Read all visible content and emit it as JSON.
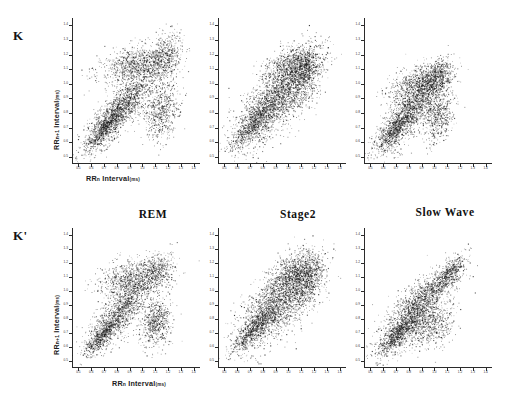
{
  "figure": {
    "row_labels": [
      {
        "id": "K",
        "text": "K"
      },
      {
        "id": "Kprime",
        "text": "K'"
      }
    ],
    "column_headers": [
      "REM",
      "Stage2",
      "Slow Wave"
    ],
    "axis": {
      "x_title_main": "RR",
      "x_title_sub": "n",
      "x_title_rest": " Interval",
      "x_title_unit": "(ms)",
      "y_title_main": "RR",
      "y_title_sub": "n+1",
      "y_title_rest": " Interval",
      "y_title_unit": "(ms)",
      "x_ticks": [
        "0.5",
        "0.6",
        "0.7",
        "0.8",
        "0.9",
        "1.0",
        "1.1",
        "1.2",
        "1.3",
        "1.4"
      ],
      "y_ticks": [
        "0.5",
        "0.6",
        "0.7",
        "0.8",
        "0.9",
        "1.0",
        "1.1",
        "1.2",
        "1.3",
        "1.4"
      ],
      "xlim": [
        0.45,
        1.45
      ],
      "ylim": [
        0.45,
        1.45
      ]
    }
  },
  "chart_data": {
    "type": "scatter",
    "xlabel": "RRn Interval (ms)",
    "ylabel": "RRn+1 Interval (ms)",
    "xlim": [
      0.45,
      1.45
    ],
    "ylim": [
      0.45,
      1.45
    ],
    "grid": false,
    "legend": "none",
    "rows": [
      "K",
      "K'"
    ],
    "columns": [
      "REM",
      "Stage2",
      "Slow Wave"
    ],
    "panels": [
      {
        "row": "K",
        "column": "REM",
        "n_points": 4200,
        "description": "Broad fan-shaped cluster with a dense diagonal band from 0.55 to 1.25 s plus a detached lower-right sub-cluster near (1.15, 0.80) and an upper band near (1.15, 1.20)",
        "clusters": [
          {
            "cx": 0.82,
            "cy": 0.82,
            "sx": 0.13,
            "sy": 0.13,
            "rho": 0.82,
            "weight": 0.38
          },
          {
            "cx": 0.95,
            "cy": 1.13,
            "sx": 0.14,
            "sy": 0.07,
            "rho": 0.35,
            "weight": 0.24
          },
          {
            "cx": 1.17,
            "cy": 1.18,
            "sx": 0.07,
            "sy": 0.09,
            "rho": 0.3,
            "weight": 0.12
          },
          {
            "cx": 1.14,
            "cy": 0.82,
            "sx": 0.07,
            "sy": 0.1,
            "rho": 0.1,
            "weight": 0.14
          },
          {
            "cx": 0.7,
            "cy": 0.7,
            "sx": 0.08,
            "sy": 0.08,
            "rho": 0.88,
            "weight": 0.12
          }
        ]
      },
      {
        "row": "K",
        "column": "Stage2",
        "n_points": 4200,
        "description": "Compact square-to-diamond cloud centred near (0.90, 0.90) with a dense upper-right diagonal ridge reaching 1.25 s",
        "clusters": [
          {
            "cx": 0.88,
            "cy": 0.88,
            "sx": 0.15,
            "sy": 0.15,
            "rho": 0.7,
            "weight": 0.5
          },
          {
            "cx": 1.05,
            "cy": 1.12,
            "sx": 0.11,
            "sy": 0.07,
            "rho": 0.4,
            "weight": 0.2
          },
          {
            "cx": 1.12,
            "cy": 1.05,
            "sx": 0.07,
            "sy": 0.11,
            "rho": 0.4,
            "weight": 0.15
          },
          {
            "cx": 0.72,
            "cy": 0.72,
            "sx": 0.08,
            "sy": 0.08,
            "rho": 0.85,
            "weight": 0.15
          }
        ]
      },
      {
        "row": "K",
        "column": "Slow Wave",
        "n_points": 3800,
        "description": "Triangular cloud from 0.60 to 1.15 s with a pronounced diagonal ridge and a lower-right lobe near (1.05, 0.75)",
        "clusters": [
          {
            "cx": 0.8,
            "cy": 0.8,
            "sx": 0.13,
            "sy": 0.13,
            "rho": 0.8,
            "weight": 0.42
          },
          {
            "cx": 0.88,
            "cy": 1.0,
            "sx": 0.12,
            "sy": 0.07,
            "rho": 0.45,
            "weight": 0.22
          },
          {
            "cx": 1.02,
            "cy": 1.05,
            "sx": 0.06,
            "sy": 0.06,
            "rho": 0.5,
            "weight": 0.12
          },
          {
            "cx": 1.03,
            "cy": 0.78,
            "sx": 0.06,
            "sy": 0.09,
            "rho": 0.2,
            "weight": 0.14
          },
          {
            "cx": 0.68,
            "cy": 0.68,
            "sx": 0.07,
            "sy": 0.07,
            "rho": 0.88,
            "weight": 0.1
          }
        ]
      },
      {
        "row": "K'",
        "column": "REM",
        "n_points": 3600,
        "description": "Sparser fan with diagonal band 0.60-1.15 s and a separate lower-right island near (1.10, 0.75)",
        "clusters": [
          {
            "cx": 0.82,
            "cy": 0.85,
            "sx": 0.12,
            "sy": 0.13,
            "rho": 0.78,
            "weight": 0.36
          },
          {
            "cx": 0.92,
            "cy": 1.1,
            "sx": 0.13,
            "sy": 0.07,
            "rho": 0.35,
            "weight": 0.24
          },
          {
            "cx": 1.12,
            "cy": 1.13,
            "sx": 0.06,
            "sy": 0.07,
            "rho": 0.3,
            "weight": 0.1
          },
          {
            "cx": 1.1,
            "cy": 0.78,
            "sx": 0.06,
            "sy": 0.09,
            "rho": 0.15,
            "weight": 0.16
          },
          {
            "cx": 0.68,
            "cy": 0.68,
            "sx": 0.07,
            "sy": 0.07,
            "rho": 0.88,
            "weight": 0.14
          }
        ]
      },
      {
        "row": "K'",
        "column": "Stage2",
        "n_points": 4000,
        "description": "Dense diamond cloud centred near (0.92, 0.92) extending to 1.25 s along the identity line",
        "clusters": [
          {
            "cx": 0.9,
            "cy": 0.9,
            "sx": 0.15,
            "sy": 0.15,
            "rho": 0.68,
            "weight": 0.52
          },
          {
            "cx": 1.06,
            "cy": 1.14,
            "sx": 0.1,
            "sy": 0.07,
            "rho": 0.4,
            "weight": 0.18
          },
          {
            "cx": 1.14,
            "cy": 1.06,
            "sx": 0.07,
            "sy": 0.1,
            "rho": 0.4,
            "weight": 0.15
          },
          {
            "cx": 0.73,
            "cy": 0.73,
            "sx": 0.08,
            "sy": 0.08,
            "rho": 0.86,
            "weight": 0.15
          }
        ]
      },
      {
        "row": "K'",
        "column": "Slow Wave",
        "n_points": 3500,
        "description": "Wedge-shaped cloud with a long thin diagonal ridge up to 1.20 s and a broad low lobe around (0.95, 0.75)",
        "clusters": [
          {
            "cx": 0.8,
            "cy": 0.78,
            "sx": 0.12,
            "sy": 0.11,
            "rho": 0.75,
            "weight": 0.4
          },
          {
            "cx": 0.95,
            "cy": 1.0,
            "sx": 0.13,
            "sy": 0.09,
            "rho": 0.72,
            "weight": 0.22
          },
          {
            "cx": 1.12,
            "cy": 1.14,
            "sx": 0.06,
            "sy": 0.06,
            "rho": 0.75,
            "weight": 0.12
          },
          {
            "cx": 0.98,
            "cy": 0.76,
            "sx": 0.09,
            "sy": 0.08,
            "rho": 0.25,
            "weight": 0.16
          },
          {
            "cx": 0.68,
            "cy": 0.66,
            "sx": 0.06,
            "sy": 0.06,
            "rho": 0.85,
            "weight": 0.1
          }
        ]
      }
    ]
  }
}
